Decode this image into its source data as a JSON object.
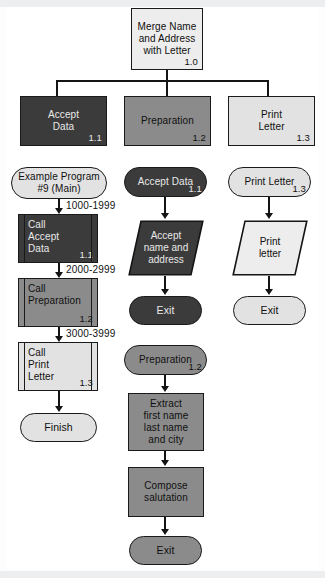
{
  "diagram": {
    "title_node": {
      "label_lines": [
        "Merge Name",
        "and Address",
        "with Letter"
      ],
      "id": "1.0",
      "fill": "#ededed"
    },
    "hierarchy": [
      {
        "name": "accept-data",
        "label_lines": [
          "Accept",
          "Data"
        ],
        "id": "1.1",
        "fill": "#3b3b3b"
      },
      {
        "name": "preparation",
        "label_lines": [
          "Preparation"
        ],
        "id": "1.2",
        "fill": "#8b8b8b"
      },
      {
        "name": "print-letter",
        "label_lines": [
          "Print",
          "Letter"
        ],
        "id": "1.3",
        "fill": "#e2e2e2"
      }
    ],
    "main_flow": {
      "start": {
        "label_lines": [
          "Example Program",
          "#9 (Main)"
        ],
        "fill": "#e2e2e2"
      },
      "steps": [
        {
          "label_lines": [
            "Call",
            "Accept",
            "Data"
          ],
          "id": "1.1",
          "range": "1000-1999",
          "fill": "#3b3b3b"
        },
        {
          "label_lines": [
            "Call",
            "Preparation"
          ],
          "id": "1.2",
          "range": "2000-2999",
          "fill": "#8b8b8b"
        },
        {
          "label_lines": [
            "Call",
            "Print",
            "Letter"
          ],
          "id": "1.3",
          "range": "3000-3999",
          "fill": "#e2e2e2"
        }
      ],
      "end": {
        "label": "Finish",
        "fill": "#e2e2e2"
      }
    },
    "accept_data_module": {
      "start": {
        "label": "Accept Data",
        "id": "1.1",
        "fill": "#3b3b3b"
      },
      "io": {
        "label_lines": [
          "Accept",
          "name and",
          "address"
        ],
        "fill": "#3b3b3b"
      },
      "end": {
        "label": "Exit",
        "fill": "#3b3b3b"
      }
    },
    "preparation_module": {
      "start": {
        "label": "Preparation",
        "id": "1.2",
        "fill": "#8b8b8b"
      },
      "process1": {
        "label_lines": [
          "Extract",
          "first name",
          "last name",
          "and city"
        ],
        "fill": "#8b8b8b"
      },
      "process2": {
        "label_lines": [
          "Compose",
          "salutation"
        ],
        "fill": "#8b8b8b"
      },
      "end": {
        "label": "Exit",
        "fill": "#8b8b8b"
      }
    },
    "print_letter_module": {
      "start": {
        "label": "Print Letter",
        "id": "1.3",
        "fill": "#e2e2e2"
      },
      "io": {
        "label_lines": [
          "Print",
          "letter"
        ],
        "fill": "#ededed"
      },
      "end": {
        "label": "Exit",
        "fill": "#e2e2e2"
      }
    },
    "colors": {
      "dark": "#3b3b3b",
      "mid": "#8b8b8b",
      "light": "#e2e2e2",
      "pale": "#ededed",
      "stroke": "#141414",
      "page": "#ffffff"
    }
  }
}
